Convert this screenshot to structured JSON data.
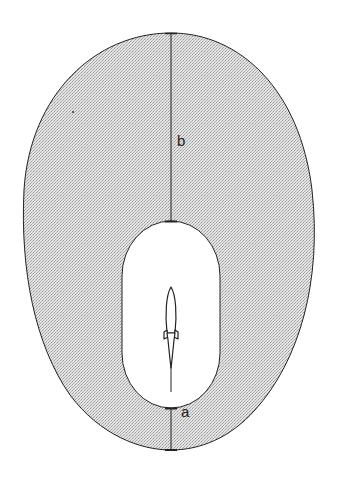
{
  "diagram": {
    "colors": {
      "background": "#ffffff",
      "outer_fill": "#d9d9d9",
      "stroke": "#222222",
      "inner_fill": "#ffffff"
    },
    "labels": {
      "b": "b",
      "a": "a"
    },
    "objects": [
      "outer-region",
      "inner-region",
      "rocket",
      "dimension-b",
      "dimension-a"
    ]
  }
}
